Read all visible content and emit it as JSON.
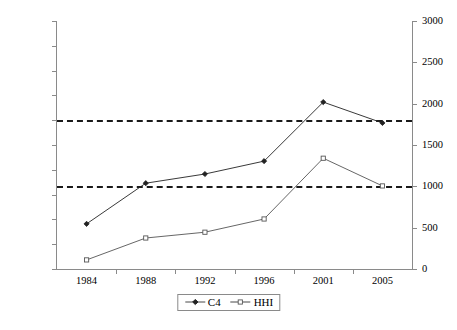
{
  "chart_data": {
    "type": "line",
    "title": "",
    "subtitle": "",
    "xlabel": "",
    "ylabel": "",
    "y2label": "",
    "categories": [
      "1984",
      "1988",
      "1992",
      "1996",
      "2001",
      "2005"
    ],
    "grid": false,
    "legend_position": "bottom-center",
    "axes": {
      "left": {
        "min": 0.0,
        "max": 100.0,
        "step": 10.0,
        "ticks": [
          "0.0",
          "10.0",
          "20.0",
          "30.0",
          "40.0",
          "50.0",
          "60.0",
          "70.0",
          "80.0",
          "90.0",
          "100.0"
        ]
      },
      "right": {
        "min": 0,
        "max": 3000,
        "step": 500,
        "ticks": [
          "0",
          "500",
          "1000",
          "1500",
          "2000",
          "2500",
          "3000"
        ]
      }
    },
    "series": [
      {
        "name": "C4",
        "axis": "left",
        "marker": "filled-diamond",
        "color": "#222222",
        "values": [
          18.2,
          34.6,
          38.3,
          43.5,
          67.3,
          58.9
        ]
      },
      {
        "name": "HHI",
        "axis": "right",
        "marker": "open-square",
        "color": "#555555",
        "values": [
          110,
          375,
          445,
          605,
          1340,
          1005
        ]
      }
    ],
    "reference_lines": [
      {
        "label": "1800",
        "left_value": 60.0,
        "right_value": 1800,
        "style": "dashed"
      },
      {
        "label": "1000",
        "left_value": 33.5,
        "right_value": 1000,
        "style": "dashed"
      }
    ],
    "legend": [
      {
        "label": "C4",
        "marker": "filled-diamond"
      },
      {
        "label": "HHI",
        "marker": "open-square"
      }
    ]
  }
}
